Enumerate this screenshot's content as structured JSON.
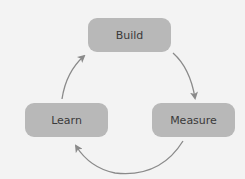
{
  "diagram": {
    "type": "cycle",
    "nodes": [
      {
        "id": "build",
        "label": "Build"
      },
      {
        "id": "measure",
        "label": "Measure"
      },
      {
        "id": "learn",
        "label": "Learn"
      }
    ],
    "edges": [
      {
        "from": "build",
        "to": "measure"
      },
      {
        "from": "measure",
        "to": "learn"
      },
      {
        "from": "learn",
        "to": "build"
      }
    ]
  },
  "colors": {
    "background": "#f3f3f3",
    "node_fill": "#b8b8b8",
    "node_text": "#3a3a3a",
    "arrow": "#8a8a8a"
  }
}
